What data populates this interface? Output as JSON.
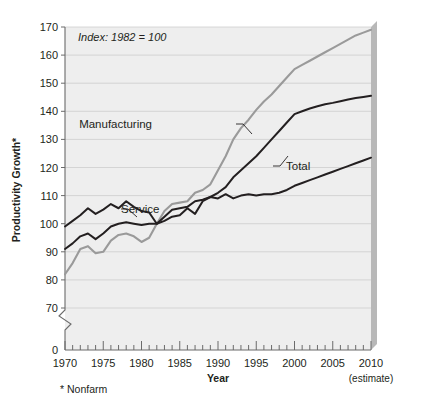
{
  "chart_data": {
    "type": "line",
    "title": "",
    "xlabel": "Year",
    "ylabel": "Productivity Growth*",
    "annotation": "Index: 1982 = 100",
    "footnote": "* Nonfarm",
    "estimate_note": "(estimate)",
    "xlim": [
      1970,
      2010
    ],
    "ylim": [
      70,
      170
    ],
    "axis_break": true,
    "axis_break_base": 0,
    "grid": true,
    "legend_position": "inline-labels",
    "ytick_labels": [
      "0",
      "70",
      "80",
      "90",
      "100",
      "110",
      "120",
      "130",
      "140",
      "150",
      "160",
      "170"
    ],
    "xtick_labels": [
      "1970",
      "1975",
      "1980",
      "1985",
      "1990",
      "1995",
      "2000",
      "2005",
      "2010"
    ],
    "xtick_minor_step": 1,
    "x": [
      1970,
      1971,
      1972,
      1973,
      1974,
      1975,
      1976,
      1977,
      1978,
      1979,
      1980,
      1981,
      1982,
      1983,
      1984,
      1985,
      1986,
      1987,
      1988,
      1989,
      1990,
      1991,
      1992,
      1993,
      1994,
      1995,
      1996,
      1997,
      1998,
      1999,
      2000,
      2001,
      2002,
      2003,
      2004,
      2005,
      2006,
      2007,
      2008,
      2009,
      2010
    ],
    "series": [
      {
        "name": "Manufacturing",
        "color": "#9a9a9a",
        "values": [
          82,
          86,
          91,
          92,
          89.5,
          90,
          94,
          96,
          96.5,
          95.5,
          93.5,
          95,
          100,
          104.5,
          107,
          107.5,
          108,
          111,
          112,
          114,
          119,
          124,
          130,
          134,
          137,
          140.5,
          143.5,
          146,
          149,
          152,
          155,
          156.5,
          158,
          159.5,
          161,
          162.5,
          164,
          165.5,
          167,
          168,
          169
        ]
      },
      {
        "name": "Total",
        "color": "#231f20",
        "values": [
          91,
          93,
          95.5,
          96.5,
          94.5,
          96.5,
          99,
          100,
          100.5,
          100,
          99.5,
          100,
          100,
          102.5,
          105,
          105.5,
          106,
          108,
          108.5,
          109.5,
          111,
          113,
          116.5,
          119,
          121.5,
          124,
          127,
          130,
          133,
          136,
          139,
          140,
          141,
          141.8,
          142.5,
          143,
          143.6,
          144.2,
          144.7,
          145.1,
          145.5
        ]
      },
      {
        "name": "Service",
        "color": "#231f20",
        "values": [
          99,
          101,
          103,
          105.5,
          103.5,
          105,
          107,
          105.5,
          108,
          106,
          104.5,
          104,
          100,
          101,
          102.5,
          103,
          105.5,
          103.5,
          108,
          109.5,
          109,
          110.5,
          109,
          110,
          110.5,
          110,
          110.5,
          110.5,
          111,
          112,
          113.5,
          114.5,
          115.5,
          116.5,
          117.5,
          118.5,
          119.5,
          120.5,
          121.5,
          122.5,
          123.5
        ]
      }
    ]
  }
}
